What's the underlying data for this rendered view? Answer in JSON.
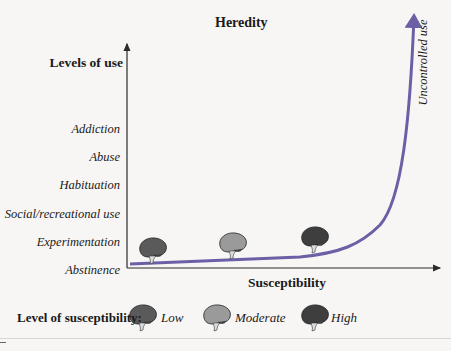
{
  "title": "Heredity",
  "y_axis": {
    "title": "Levels of use",
    "levels": [
      "Addiction",
      "Abuse",
      "Habituation",
      "Social/recreational use",
      "Experimentation",
      "Abstinence"
    ]
  },
  "x_axis": {
    "title": "Susceptibility"
  },
  "curve_label": "Uncontrolled use",
  "legend": {
    "label": "Level of susceptibility:",
    "items": [
      {
        "name": "Low",
        "color": "#5a5a5a"
      },
      {
        "name": "Moderate",
        "color": "#9a9a9a"
      },
      {
        "name": "High",
        "color": "#3e3e3e"
      }
    ]
  },
  "colors": {
    "curve": "#6b5fa6",
    "axis": "#2b2b2b"
  }
}
